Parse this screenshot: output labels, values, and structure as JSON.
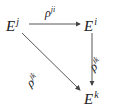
{
  "diagram": {
    "type": "commutative-triangle",
    "nodes": {
      "ej": {
        "base": "E",
        "sup": "j"
      },
      "ei": {
        "base": "E",
        "sup": "i"
      },
      "ek": {
        "base": "E",
        "sup": "k"
      }
    },
    "edges": {
      "rho_ji": {
        "base": "ρ",
        "sup": "ji",
        "from": "E^j",
        "to": "E^i"
      },
      "rho_ik": {
        "base": "ρ",
        "sup": "ik",
        "from": "E^i",
        "to": "E^k"
      },
      "rho_jk": {
        "base": "ρ",
        "sup": "jk",
        "from": "E^j",
        "to": "E^k"
      }
    },
    "colors": {
      "stroke": "#444444",
      "text": "#222222"
    }
  }
}
